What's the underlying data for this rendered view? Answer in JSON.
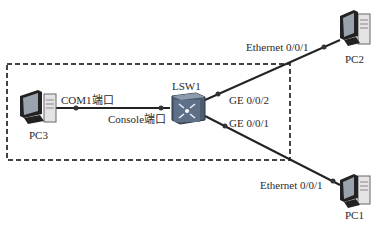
{
  "nodes": {
    "pc1": {
      "label": "PC1"
    },
    "pc2": {
      "label": "PC2"
    },
    "pc3": {
      "label": "PC3"
    },
    "lsw1": {
      "label": "LSW1"
    }
  },
  "links": {
    "pc3_com": {
      "label": "COM1端口"
    },
    "lsw1_console": {
      "label": "Console端口"
    },
    "lsw1_ge2": {
      "label": "GE 0/0/2"
    },
    "lsw1_ge1": {
      "label": "GE 0/0/1"
    },
    "pc2_eth": {
      "label": "Ethernet 0/0/1"
    },
    "pc1_eth": {
      "label": "Ethernet 0/0/1"
    }
  },
  "colors": {
    "line": "#222222",
    "dashed_box": "#444444",
    "switch": "#5a6b7e"
  }
}
